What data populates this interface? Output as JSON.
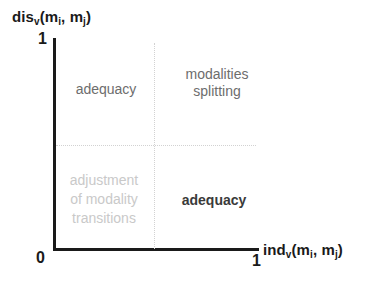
{
  "figure": {
    "type": "quadrant-diagram",
    "background_color": "#ffffff"
  },
  "axes": {
    "y": {
      "label_prefix": "dis",
      "label_sub": "v",
      "label_open": "(m",
      "label_sub2": "i",
      "label_comma": ", m",
      "label_sub3": "j",
      "label_close": ")",
      "label_plain": "disv(mi, mj)",
      "max_tick": "1",
      "min_tick": "0"
    },
    "x": {
      "label_prefix": "ind",
      "label_sub": "v",
      "label_open": "(m",
      "label_sub2": "i",
      "label_comma": ", m",
      "label_sub3": "j",
      "label_close": ")",
      "label_plain": "indv(mi, mj)",
      "max_tick": "1",
      "min_tick": "0"
    },
    "origin_tick": "0",
    "axis_color": "#1a1a1a",
    "grid_color": "#d2d2d2",
    "grid_style": "dotted"
  },
  "quadrants": {
    "top_left": {
      "text": "adequacy",
      "color": "#6d6d6d"
    },
    "top_right": {
      "text": "modalities\nsplitting",
      "color": "#6d6d6d"
    },
    "bottom_left": {
      "text": "adjustment\nof modality\ntransitions",
      "color": "#c9c9c9"
    },
    "bottom_right": {
      "text": "adequacy",
      "color": "#3a3a3a"
    }
  },
  "chart_data": {
    "type": "scatter",
    "title": "",
    "xlabel": "indv(mi, mj)",
    "ylabel": "disv(mi, mj)",
    "xlim": [
      0,
      1
    ],
    "ylim": [
      0,
      1
    ],
    "xticks": [
      "0",
      "1"
    ],
    "yticks": [
      "0",
      "1"
    ],
    "grid": true,
    "grid_lines": {
      "vertical": [
        0.5
      ],
      "horizontal": [
        0.5
      ]
    },
    "legend": "none",
    "annotations": [
      {
        "quadrant": "top-left",
        "x": 0.25,
        "y": 0.75,
        "text": "adequacy"
      },
      {
        "quadrant": "top-right",
        "x": 0.75,
        "y": 0.78,
        "text": "modalities splitting"
      },
      {
        "quadrant": "bottom-left",
        "x": 0.25,
        "y": 0.25,
        "text": "adjustment of modality transitions"
      },
      {
        "quadrant": "bottom-right",
        "x": 0.75,
        "y": 0.22,
        "text": "adequacy"
      }
    ],
    "series": []
  }
}
